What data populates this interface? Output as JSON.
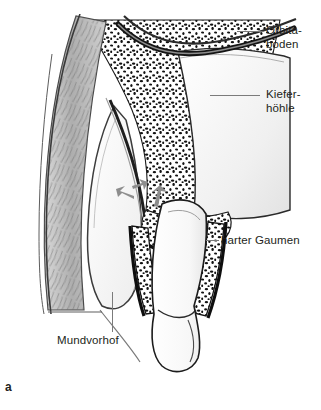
{
  "figure": {
    "letter": "a",
    "domain_kind": "anatomical-illustration",
    "colors": {
      "ink": "#231f20",
      "leader": "#7b7b7b",
      "frame": "#d2d2d2",
      "soft_tissue": "#b9b9b9",
      "bone_cortex": "#1a1a1a",
      "sinus_cavity": "#f2f2f2",
      "tooth": "#ffffff",
      "arrow": "#8a8a8a",
      "background": "#ffffff"
    }
  },
  "labels": [
    {
      "id": "orbitaboden",
      "text": "Orbita-\nboden",
      "leader": "horizontal"
    },
    {
      "id": "kieferhoehle",
      "text": "Kiefer-\nhöhle",
      "leader": "horizontal"
    },
    {
      "id": "harter_gaumen",
      "text": "harter Gaumen",
      "leader": "horizontal"
    },
    {
      "id": "mundvorhof",
      "text": "Mundvorhof",
      "leader": "vertical"
    }
  ],
  "structures": [
    {
      "name": "orbital-floor",
      "label_ref": "orbitaboden"
    },
    {
      "name": "maxillary-sinus",
      "label_ref": "kieferhoehle"
    },
    {
      "name": "hard-palate",
      "label_ref": "harter_gaumen"
    },
    {
      "name": "oral-vestibule",
      "label_ref": "mundvorhof"
    },
    {
      "name": "tooth",
      "label_ref": null
    },
    {
      "name": "eruption-arrows",
      "label_ref": null,
      "count": 2
    }
  ]
}
